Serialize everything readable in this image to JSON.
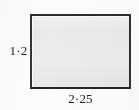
{
  "figure": {
    "name": "rectangle-dimension-figure",
    "shape": "rectangle",
    "fill_color": "#ebebeb",
    "border_color": "#2c2c2c",
    "background_color": "#fcfcfb"
  },
  "labels": {
    "height": "1·2",
    "width": "2·25"
  },
  "chart_data": {
    "type": "diagram",
    "title": "",
    "shape": "rectangle",
    "annotations": [
      {
        "text": "1·2",
        "position": "left",
        "meaning": "height"
      },
      {
        "text": "2·25",
        "position": "bottom",
        "meaning": "width"
      }
    ]
  }
}
